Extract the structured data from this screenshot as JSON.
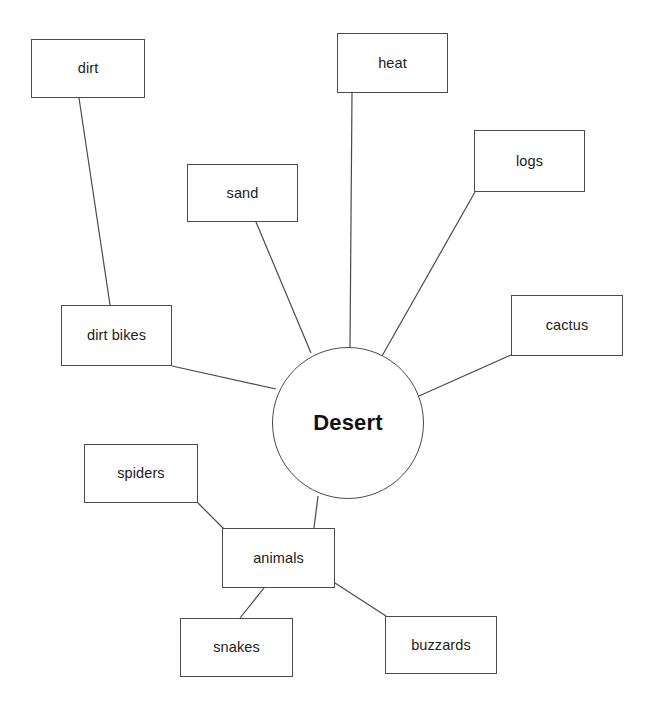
{
  "diagram": {
    "type": "mind-map",
    "title": "Desert",
    "center": {
      "id": "desert",
      "label": "Desert",
      "shape": "circle",
      "cx": 348,
      "cy": 423,
      "r": 76
    },
    "nodes": [
      {
        "id": "dirt",
        "label": "dirt",
        "x": 31,
        "y": 39,
        "w": 114,
        "h": 59
      },
      {
        "id": "heat",
        "label": "heat",
        "x": 337,
        "y": 33,
        "w": 111,
        "h": 60
      },
      {
        "id": "logs",
        "label": "logs",
        "x": 474,
        "y": 130,
        "w": 111,
        "h": 62
      },
      {
        "id": "sand",
        "label": "sand",
        "x": 187,
        "y": 164,
        "w": 111,
        "h": 58
      },
      {
        "id": "cactus",
        "label": "cactus",
        "x": 511,
        "y": 295,
        "w": 112,
        "h": 61
      },
      {
        "id": "dirt-bikes",
        "label": "dirt bikes",
        "x": 61,
        "y": 305,
        "w": 111,
        "h": 61
      },
      {
        "id": "spiders",
        "label": "spiders",
        "x": 84,
        "y": 444,
        "w": 114,
        "h": 59
      },
      {
        "id": "animals",
        "label": "animals",
        "x": 222,
        "y": 528,
        "w": 113,
        "h": 60
      },
      {
        "id": "snakes",
        "label": "snakes",
        "x": 180,
        "y": 618,
        "w": 113,
        "h": 59
      },
      {
        "id": "buzzards",
        "label": "buzzards",
        "x": 385,
        "y": 616,
        "w": 112,
        "h": 58
      }
    ],
    "edges": [
      {
        "id": "edge-dirt-dirtbikes",
        "from": "dirt",
        "to": "dirt-bikes",
        "x1": 79,
        "y1": 98,
        "x2": 110,
        "y2": 305
      },
      {
        "id": "edge-dirtbikes-desert",
        "from": "dirt-bikes",
        "to": "desert",
        "x1": 172,
        "y1": 366,
        "x2": 276,
        "y2": 389
      },
      {
        "id": "edge-sand-desert",
        "from": "sand",
        "to": "desert",
        "x1": 256,
        "y1": 222,
        "x2": 311,
        "y2": 353
      },
      {
        "id": "edge-heat-desert",
        "from": "heat",
        "to": "desert",
        "x1": 352,
        "y1": 93,
        "x2": 350,
        "y2": 347
      },
      {
        "id": "edge-logs-desert",
        "from": "logs",
        "to": "desert",
        "x1": 475,
        "y1": 192,
        "x2": 382,
        "y2": 356
      },
      {
        "id": "edge-cactus-desert",
        "from": "cactus",
        "to": "desert",
        "x1": 511,
        "y1": 355,
        "x2": 419,
        "y2": 396
      },
      {
        "id": "edge-desert-animals",
        "from": "desert",
        "to": "animals",
        "x1": 318,
        "y1": 496,
        "x2": 314,
        "y2": 528
      },
      {
        "id": "edge-spiders-animals",
        "from": "spiders",
        "to": "animals",
        "x1": 198,
        "y1": 503,
        "x2": 224,
        "y2": 529
      },
      {
        "id": "edge-animals-snakes",
        "from": "animals",
        "to": "snakes",
        "x1": 264,
        "y1": 588,
        "x2": 240,
        "y2": 618
      },
      {
        "id": "edge-animals-buzzards",
        "from": "animals",
        "to": "buzzards",
        "x1": 335,
        "y1": 583,
        "x2": 386,
        "y2": 616
      }
    ],
    "colors": {
      "background": "#ffffff",
      "stroke": "#4a4a4a",
      "text": "#1b1b1b",
      "center_text": "#111111"
    }
  }
}
